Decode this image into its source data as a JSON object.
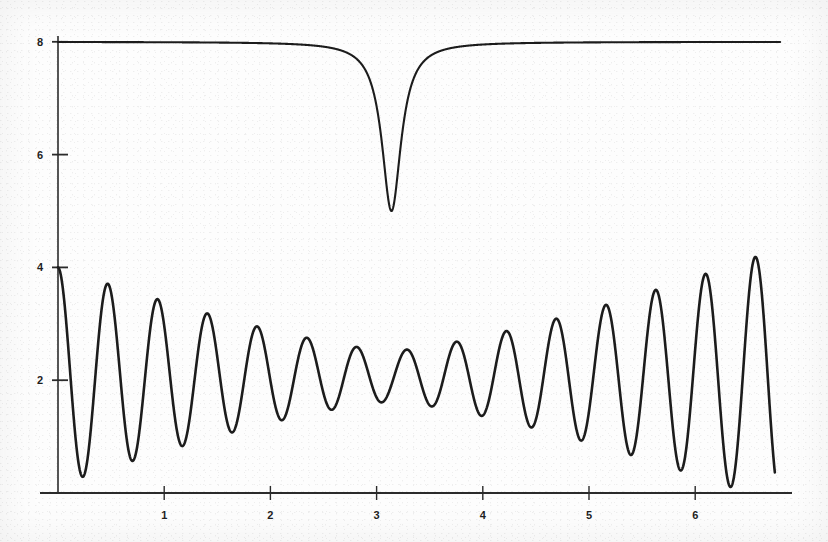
{
  "chart_data": {
    "type": "line",
    "title": "",
    "subtitle": "",
    "xlabel": "",
    "ylabel": "",
    "xlim": [
      0,
      6.8
    ],
    "ylim": [
      0,
      8.6
    ],
    "grid": false,
    "legend": null,
    "x_ticks": [
      1,
      2,
      3,
      4,
      5,
      6
    ],
    "x_tick_labels": [
      "1",
      "2",
      "3",
      "4",
      "5",
      "6"
    ],
    "y_ticks": [
      2,
      4,
      6,
      8
    ],
    "y_tick_labels": [
      "2",
      "4",
      "6",
      "8"
    ],
    "series": [
      {
        "name": "upper-dip-curve",
        "description": "Flat baseline at 8 with a narrow symmetric dip reaching a minimum of 5 at x = 3.14",
        "baseline": 8,
        "dip_center": 3.14,
        "dip_depth": 3,
        "dip_halfwidth": 0.11,
        "x": [
          0.0,
          0.3,
          0.6,
          0.9,
          1.2,
          1.5,
          1.8,
          2.1,
          2.4,
          2.6,
          2.75,
          2.85,
          2.92,
          2.97,
          3.01,
          3.05,
          3.08,
          3.11,
          3.14,
          3.17,
          3.2,
          3.23,
          3.27,
          3.32,
          3.39,
          3.48,
          3.6,
          3.8,
          4.1,
          4.5,
          5.0,
          5.6,
          6.2,
          6.8
        ],
        "values": [
          8.0,
          8.0,
          8.0,
          8.0,
          8.0,
          7.99,
          7.99,
          7.98,
          7.96,
          7.92,
          7.85,
          7.76,
          7.65,
          7.48,
          7.26,
          6.88,
          6.45,
          5.75,
          5.0,
          5.72,
          6.4,
          6.85,
          7.26,
          7.55,
          7.76,
          7.88,
          7.94,
          7.97,
          7.99,
          8.0,
          8.0,
          8.0,
          8.0,
          8.0
        ]
      },
      {
        "name": "lower-oscillation-curve",
        "description": "Beat / amplitude-modulated oscillation about a mean of ~2.07, envelope 1.93 at the edges collapsing to ~0.45 near x = 3.14, roughly 14.5 cycles across the plotted range",
        "mean": 2.07,
        "envelope_edge": 1.93,
        "envelope_center": 0.45,
        "cycles": 14.5,
        "start_value": 4.0,
        "end_value": 3.25,
        "peaks_x": [
          0.0,
          0.47,
          0.93,
          1.4,
          1.86,
          2.33,
          2.79,
          3.26,
          3.72,
          4.19,
          4.65,
          5.12,
          5.58,
          6.05,
          6.51
        ],
        "peaks_y": [
          4.0,
          3.8,
          3.62,
          3.45,
          3.0,
          2.58,
          2.3,
          2.4,
          2.75,
          3.2,
          3.5,
          3.68,
          3.8,
          3.88,
          3.8
        ],
        "troughs_x": [
          0.23,
          0.7,
          1.16,
          1.63,
          2.09,
          2.56,
          3.02,
          3.49,
          3.95,
          4.42,
          4.88,
          5.35,
          5.81,
          6.28
        ],
        "troughs_y": [
          0.18,
          0.25,
          0.35,
          0.55,
          0.95,
          1.35,
          1.7,
          1.62,
          1.25,
          0.8,
          0.45,
          0.25,
          0.18,
          0.15
        ]
      }
    ],
    "axis_color": "#2b2b2b",
    "curve_color": "#1c1c1c",
    "background_color": "#fdfdfd"
  },
  "figure": {
    "caption": "",
    "media_type": "scanned-line-plot"
  }
}
